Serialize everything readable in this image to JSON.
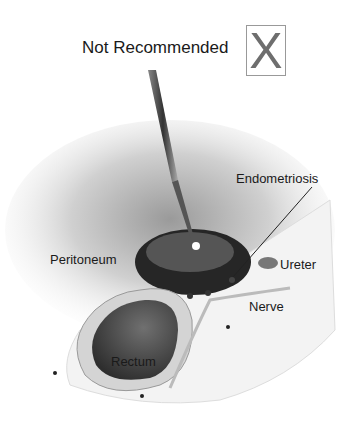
{
  "header": {
    "title": "Not Recommended",
    "mark": "X"
  },
  "labels": {
    "endometriosis": "Endometriosis",
    "peritoneum": "Peritoneum",
    "ureter": "Ureter",
    "nerve": "Nerve",
    "rectum": "Rectum"
  },
  "colors": {
    "lesion": "#222222",
    "rectum": "#4a4a4a",
    "background": "#ffffff"
  }
}
